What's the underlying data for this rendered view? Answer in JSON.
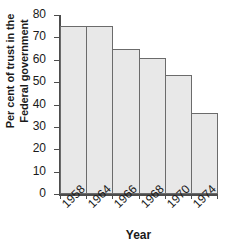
{
  "chart_data": {
    "type": "bar",
    "title": "",
    "subtitle": "",
    "xlabel": "Year",
    "ylabel": "Per cent of trust in the Federal government",
    "ylabel_lines": [
      "Per cent of trust in the",
      "Federal government"
    ],
    "categories": [
      "1958",
      "1964",
      "1966",
      "1968",
      "1970",
      "1974"
    ],
    "values": [
      75,
      75,
      65,
      61,
      53,
      36
    ],
    "ylim": [
      0,
      80
    ],
    "ytick_step": 10,
    "yticks": [
      "80",
      "70",
      "60",
      "50",
      "40",
      "30",
      "20",
      "10",
      "0"
    ],
    "ytick_values": [
      80,
      70,
      60,
      50,
      40,
      30,
      20,
      10,
      0
    ],
    "grid": false,
    "legend": false,
    "legend_position": "none",
    "annotations": [],
    "bar_gap": 0,
    "xtick_label_rotation": -45,
    "colors": {
      "bar_fill": "#e8e8e8",
      "bar_border": "#6b6b6b",
      "axis": "#4d4d4d",
      "text": "#1a1a1a",
      "background": "#ffffff"
    }
  }
}
